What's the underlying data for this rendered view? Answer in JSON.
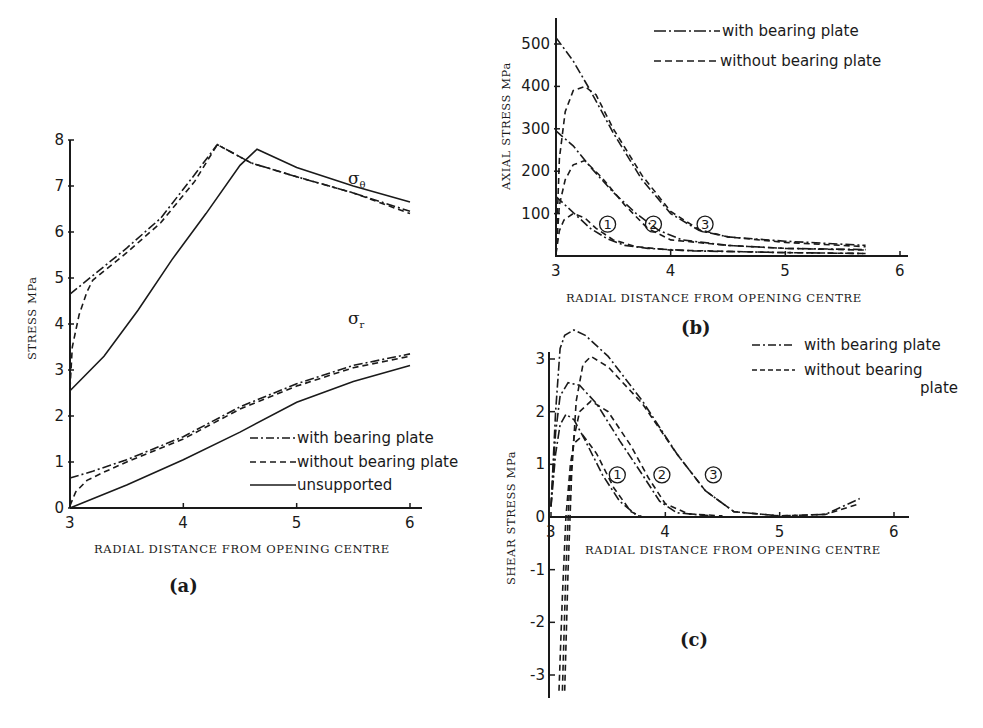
{
  "chart_data": [
    {
      "id": "a",
      "type": "line",
      "panel_label": "(a)",
      "title": "",
      "xlabel": "RADIAL DISTANCE FROM OPENING CENTRE",
      "ylabel": "STRESS  MPa",
      "xlim": [
        3,
        6
      ],
      "ylim": [
        0,
        8
      ],
      "xticks": [
        "3",
        "4",
        "5",
        "6"
      ],
      "yticks": [
        "0",
        "1",
        "2",
        "3",
        "4",
        "5",
        "6",
        "7",
        "8"
      ],
      "grid": false,
      "legend_position": "lower right",
      "legend": [
        {
          "name": "with bearing plate",
          "style": "dashdot"
        },
        {
          "name": "without bearing plate",
          "style": "dashed"
        },
        {
          "name": "unsupported",
          "style": "solid"
        }
      ],
      "annotations": [
        {
          "text": "σθ",
          "x": 5.3,
          "y": 7.6
        },
        {
          "text": "σr",
          "x": 5.3,
          "y": 4.5
        }
      ],
      "series": [
        {
          "name": "σθ with bearing plate",
          "style": "dashdot",
          "x": [
            3.0,
            3.2,
            3.5,
            3.8,
            4.1,
            4.3,
            4.6,
            5.0,
            5.5,
            6.0
          ],
          "y": [
            4.65,
            5.05,
            5.65,
            6.3,
            7.25,
            7.9,
            7.5,
            7.2,
            6.85,
            6.45
          ]
        },
        {
          "name": "σθ without bearing plate",
          "style": "dashed",
          "x": [
            3.0,
            3.02,
            3.08,
            3.15,
            3.2,
            3.5,
            3.8,
            4.1,
            4.3,
            4.6,
            5.0,
            5.5,
            6.0
          ],
          "y": [
            2.6,
            3.5,
            4.2,
            4.7,
            4.95,
            5.55,
            6.2,
            7.1,
            7.9,
            7.5,
            7.2,
            6.85,
            6.4
          ]
        },
        {
          "name": "σθ unsupported",
          "style": "solid",
          "x": [
            3.0,
            3.3,
            3.6,
            3.9,
            4.2,
            4.5,
            4.65,
            5.0,
            5.5,
            6.0
          ],
          "y": [
            2.55,
            3.3,
            4.3,
            5.4,
            6.4,
            7.45,
            7.8,
            7.4,
            7.0,
            6.65
          ]
        },
        {
          "name": "σr with bearing plate",
          "style": "dashdot",
          "x": [
            3.0,
            3.2,
            3.5,
            4.0,
            4.5,
            5.0,
            5.5,
            6.0
          ],
          "y": [
            0.65,
            0.8,
            1.05,
            1.55,
            2.2,
            2.7,
            3.1,
            3.35
          ]
        },
        {
          "name": "σr without bearing plate",
          "style": "dashed",
          "x": [
            3.0,
            3.05,
            3.15,
            3.3,
            3.5,
            4.0,
            4.5,
            5.0,
            5.5,
            6.0
          ],
          "y": [
            0.05,
            0.35,
            0.6,
            0.78,
            1.0,
            1.5,
            2.15,
            2.65,
            3.05,
            3.3
          ]
        },
        {
          "name": "σr unsupported",
          "style": "solid",
          "x": [
            3.0,
            3.5,
            4.0,
            4.5,
            5.0,
            5.5,
            6.0
          ],
          "y": [
            0.0,
            0.5,
            1.05,
            1.65,
            2.3,
            2.75,
            3.1
          ]
        }
      ]
    },
    {
      "id": "b",
      "type": "line",
      "panel_label": "(b)",
      "title": "",
      "xlabel": "RADIAL DISTANCE FROM OPENING CENTRE",
      "ylabel": "AXIAL STRESS  MPa",
      "xlim": [
        3,
        6
      ],
      "ylim": [
        0,
        500
      ],
      "xticks": [
        "3",
        "4",
        "5",
        "6"
      ],
      "yticks": [
        "100",
        "200",
        "300",
        "400",
        "500"
      ],
      "grid": false,
      "legend_position": "upper right",
      "legend": [
        {
          "name": "with bearing plate",
          "style": "dashdot"
        },
        {
          "name": "without bearing plate",
          "style": "dashed"
        }
      ],
      "annotations": [
        {
          "text": "1",
          "x": 3.45,
          "y": 75
        },
        {
          "text": "2",
          "x": 3.85,
          "y": 75
        },
        {
          "text": "3",
          "x": 4.3,
          "y": 75
        }
      ],
      "series": [
        {
          "name": "1 with bearing plate",
          "style": "dashdot",
          "x": [
            3.0,
            3.1,
            3.2,
            3.3,
            3.45,
            3.6,
            3.8,
            4.2,
            5.0,
            5.7
          ],
          "y": [
            140,
            115,
            90,
            65,
            40,
            25,
            18,
            12,
            8,
            6
          ]
        },
        {
          "name": "1 without bearing plate",
          "style": "dashed",
          "x": [
            3.0,
            3.03,
            3.07,
            3.15,
            3.25,
            3.35,
            3.5,
            3.7,
            4.0,
            5.0,
            5.7
          ],
          "y": [
            5,
            60,
            85,
            100,
            90,
            65,
            38,
            22,
            14,
            8,
            6
          ]
        },
        {
          "name": "2 with bearing plate",
          "style": "dashdot",
          "x": [
            3.0,
            3.15,
            3.3,
            3.5,
            3.7,
            3.9,
            4.1,
            4.5,
            5.0,
            5.7
          ],
          "y": [
            295,
            260,
            210,
            150,
            100,
            60,
            38,
            25,
            18,
            15
          ]
        },
        {
          "name": "2 without bearing plate",
          "style": "dashed",
          "x": [
            3.0,
            3.03,
            3.08,
            3.15,
            3.25,
            3.4,
            3.6,
            3.8,
            4.0,
            4.5,
            5.0,
            5.7
          ],
          "y": [
            5,
            120,
            180,
            215,
            225,
            185,
            120,
            65,
            38,
            25,
            18,
            14
          ]
        },
        {
          "name": "3 with bearing plate",
          "style": "dashdot",
          "x": [
            3.0,
            3.15,
            3.3,
            3.5,
            3.75,
            4.0,
            4.25,
            4.5,
            5.0,
            5.7
          ],
          "y": [
            515,
            460,
            390,
            290,
            180,
            100,
            60,
            45,
            35,
            25
          ]
        },
        {
          "name": "3 without bearing plate",
          "style": "dashed",
          "x": [
            3.0,
            3.03,
            3.08,
            3.15,
            3.25,
            3.35,
            3.5,
            3.75,
            4.0,
            4.25,
            4.5,
            5.0,
            5.7
          ],
          "y": [
            5,
            230,
            340,
            390,
            400,
            380,
            300,
            190,
            105,
            62,
            45,
            32,
            22
          ]
        }
      ]
    },
    {
      "id": "c",
      "type": "line",
      "panel_label": "(c)",
      "title": "",
      "xlabel": "RADIAL DISTANCE FROM OPENING CENTRE",
      "ylabel": "SHEAR STRESS  MPa",
      "xlim": [
        3,
        6
      ],
      "ylim": [
        -3.3,
        3.5
      ],
      "xticks": [
        "3",
        "4",
        "5",
        "6"
      ],
      "yticks": [
        "-3",
        "-2",
        "-1",
        "0",
        "1",
        "2",
        "3"
      ],
      "grid": false,
      "legend_position": "upper right",
      "legend": [
        {
          "name": "with bearing plate",
          "style": "dashdot"
        },
        {
          "name": "without bearing plate",
          "style": "dashed"
        }
      ],
      "annotations": [
        {
          "text": "1",
          "x": 3.58,
          "y": 0.8
        },
        {
          "text": "2",
          "x": 3.97,
          "y": 0.8
        },
        {
          "text": "3",
          "x": 4.42,
          "y": 0.8
        }
      ],
      "series": [
        {
          "name": "1 with bearing plate",
          "style": "dashdot",
          "x": [
            3.0,
            3.04,
            3.08,
            3.13,
            3.2,
            3.3,
            3.45,
            3.6,
            3.75,
            3.8
          ],
          "y": [
            0.2,
            1.2,
            1.75,
            1.95,
            1.85,
            1.45,
            0.8,
            0.3,
            0.03,
            0.0
          ]
        },
        {
          "name": "1 without bearing plate",
          "style": "dashed",
          "x": [
            3.07,
            3.1,
            3.13,
            3.17,
            3.2,
            3.28,
            3.4,
            3.55,
            3.7,
            3.8
          ],
          "y": [
            -3.3,
            -1.5,
            0.0,
            1.0,
            1.4,
            1.55,
            1.2,
            0.55,
            0.1,
            0.0
          ]
        },
        {
          "name": "2 with bearing plate",
          "style": "dashdot",
          "x": [
            3.0,
            3.04,
            3.08,
            3.15,
            3.25,
            3.4,
            3.6,
            3.8,
            3.95,
            4.1,
            4.4
          ],
          "y": [
            0.2,
            1.6,
            2.3,
            2.55,
            2.5,
            2.15,
            1.45,
            0.8,
            0.3,
            0.08,
            0.02
          ]
        },
        {
          "name": "2 without bearing plate",
          "style": "dashed",
          "x": [
            3.1,
            3.13,
            3.16,
            3.2,
            3.25,
            3.35,
            3.5,
            3.7,
            3.85,
            4.0,
            4.2,
            4.5
          ],
          "y": [
            -3.3,
            -1.0,
            0.5,
            1.5,
            2.0,
            2.2,
            2.0,
            1.35,
            0.75,
            0.25,
            0.06,
            0.02
          ]
        },
        {
          "name": "3 with bearing plate",
          "style": "dashdot",
          "x": [
            3.0,
            3.04,
            3.08,
            3.12,
            3.2,
            3.3,
            3.5,
            3.8,
            4.1,
            4.35,
            4.6,
            5.0,
            5.4,
            5.7
          ],
          "y": [
            0.2,
            2.0,
            3.2,
            3.45,
            3.55,
            3.45,
            3.05,
            2.2,
            1.2,
            0.5,
            0.1,
            0.02,
            0.05,
            0.35
          ]
        },
        {
          "name": "3 without bearing plate",
          "style": "dashed",
          "x": [
            3.12,
            3.15,
            3.18,
            3.22,
            3.28,
            3.35,
            3.5,
            3.8,
            4.1,
            4.35,
            4.6,
            5.0,
            5.4,
            5.7
          ],
          "y": [
            -3.3,
            -1.0,
            0.8,
            2.2,
            2.9,
            3.05,
            2.85,
            2.15,
            1.2,
            0.5,
            0.1,
            0.02,
            0.05,
            0.25
          ]
        }
      ]
    }
  ],
  "labels": {
    "a_sigma_theta": "σ",
    "a_sigma_theta_sub": "θ",
    "a_sigma_r": "σ",
    "a_sigma_r_sub": "r"
  }
}
